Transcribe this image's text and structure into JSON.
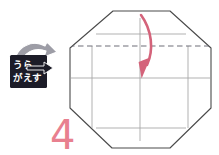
{
  "figure": {
    "step_number": "4",
    "step_number_color": "#e8808f",
    "background_color": "#ffffff"
  },
  "badge": {
    "name": "turn-over-badge",
    "label_line1": "うら",
    "label_line2": "がえす",
    "full_label": "うらがえす",
    "box_color": "#1c1c28",
    "text_color": "#ffffff",
    "arrow_fill": "#9d9da6",
    "arrow_outline": "#ffffff"
  },
  "shape": {
    "name": "octagon",
    "outline_color": "#4a4a4a",
    "fill_color": "#ffffff",
    "vertices": [
      [
        113,
        11
      ],
      [
        170,
        11
      ],
      [
        211,
        48
      ],
      [
        211,
        108
      ],
      [
        170,
        148
      ],
      [
        112,
        148
      ],
      [
        70,
        108
      ],
      [
        70,
        48
      ]
    ]
  },
  "crease_lines": {
    "solid_color": "#a8a8a8",
    "dashed_color": "#6e6e78",
    "horizontal": [
      {
        "name": "crease-horizontal-top",
        "y": 34,
        "x1": 96,
        "x2": 186,
        "style": "solid"
      },
      {
        "name": "crease-horizontal-middle",
        "y": 78,
        "x1": 72,
        "x2": 209,
        "style": "solid"
      },
      {
        "name": "crease-horizontal-bottom",
        "y": 128,
        "x1": 96,
        "x2": 186,
        "style": "solid"
      }
    ],
    "dashed": [
      {
        "name": "fold-line-dashed",
        "y": 46,
        "x1": 70,
        "x2": 211,
        "style": "dashed"
      }
    ],
    "vertical": [
      {
        "name": "crease-vertical-left",
        "x": 92,
        "y1": 46,
        "y2": 128,
        "style": "solid"
      },
      {
        "name": "crease-vertical-center",
        "x": 140,
        "y1": 18,
        "y2": 141,
        "style": "solid"
      },
      {
        "name": "crease-vertical-right",
        "x": 188,
        "y1": 46,
        "y2": 128,
        "style": "solid"
      }
    ]
  },
  "fold_arrow": {
    "name": "fold-arrow",
    "color": "#d4637a",
    "start": [
      141,
      15
    ],
    "end": [
      140,
      76
    ],
    "direction": "downward-curved",
    "description": "Curved red arrow folding the top edge down to the center line"
  }
}
